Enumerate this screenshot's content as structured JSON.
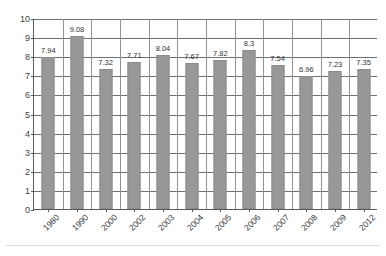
{
  "chart_data": {
    "type": "bar",
    "title": "",
    "xlabel": "",
    "ylabel": "",
    "categories": [
      "1980",
      "1990",
      "2000",
      "2002",
      "2003",
      "2004",
      "2005",
      "2006",
      "2007",
      "2008",
      "2009",
      "2012"
    ],
    "values": [
      7.94,
      9.08,
      7.32,
      7.71,
      8.04,
      7.67,
      7.82,
      8.3,
      7.54,
      6.96,
      7.23,
      7.35
    ],
    "value_labels": [
      "7.94",
      "9.08",
      "7.32",
      "7.71",
      "8.04",
      "7.67",
      "7.82",
      "8.3",
      "7.54",
      "6.96",
      "7.23",
      "7.35"
    ],
    "ylim": [
      0,
      10
    ],
    "ytick_labels": [
      "0",
      "1",
      "2",
      "3",
      "4",
      "5",
      "6",
      "7",
      "8",
      "9",
      "10"
    ],
    "ytick_values": [
      0,
      1,
      2,
      3,
      4,
      5,
      6,
      7,
      8,
      9,
      10
    ],
    "grid": true,
    "legend": false,
    "bar_color": "#989898",
    "gridline_color": "#6d7276",
    "axis_color": "#555a5e",
    "text_color": "#35393c"
  }
}
